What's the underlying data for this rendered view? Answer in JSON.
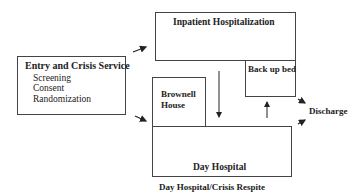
{
  "diagram": {
    "entry": {
      "title": "Entry and Crisis Service",
      "items": [
        "Screening",
        "Consent",
        "Randomization"
      ]
    },
    "inpatient": {
      "title": "Inpatient Hospitalization"
    },
    "backup_bed": {
      "title": "Back up bed"
    },
    "brownell": {
      "line1": "Brownell",
      "line2": "House"
    },
    "day_hospital": {
      "title": "Day Hospital"
    },
    "discharge": {
      "label": "Discharge"
    },
    "caption": "Day Hospital/Crisis Respite"
  }
}
